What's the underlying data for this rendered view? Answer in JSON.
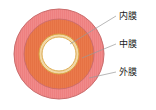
{
  "figure": {
    "type": "cross-section-diagram",
    "background_color": "#ffffff",
    "center": {
      "x": 59,
      "y": 54
    },
    "layers": [
      {
        "key": "adventitia",
        "label": "外膜",
        "order": 3,
        "fill_color": "#F08A8A",
        "stroke_color": "#C96B6B",
        "outer_radius": 45,
        "inner_radius": 35
      },
      {
        "key": "media",
        "label": "中膜",
        "order": 2,
        "fill_color": "#EA7A4C",
        "stroke_color": "#C96B6B",
        "outer_radius": 35,
        "inner_radius": 20
      },
      {
        "key": "intima",
        "label": "内膜",
        "order": 1,
        "fill_color": "#F2D8A8",
        "stroke_color": "#D9A441",
        "outer_radius": 20,
        "inner_radius": 17
      },
      {
        "key": "lumen",
        "label": "",
        "order": 0,
        "fill_color": "#FFFFFF",
        "stroke_color": "#D9A441",
        "outer_radius": 17,
        "inner_radius": 0
      }
    ],
    "leader_lines": [
      {
        "key": "intima",
        "x1": 70,
        "y1": 44,
        "x2": 116,
        "y2": 16,
        "color": "#9a9a9a"
      },
      {
        "key": "media",
        "x1": 82,
        "y1": 58,
        "x2": 116,
        "y2": 44,
        "color": "#9a9a9a"
      },
      {
        "key": "adventitia",
        "x1": 89,
        "y1": 78,
        "x2": 116,
        "y2": 72,
        "color": "#9a9a9a"
      }
    ]
  },
  "labels": {
    "intima": "内膜",
    "media": "中膜",
    "adventitia": "外膜"
  }
}
